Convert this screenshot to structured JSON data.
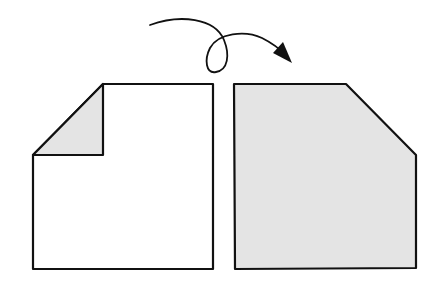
{
  "diagram": {
    "colors": {
      "stroke": "#111111",
      "paper_front": "#ffffff",
      "paper_back": "#e4e4e4",
      "background": "#ffffff"
    },
    "steps": [
      {
        "id": "folded-corner-sheet"
      },
      {
        "id": "flipped-sheet"
      }
    ],
    "arrow": {
      "meaning": "turn-over"
    }
  }
}
